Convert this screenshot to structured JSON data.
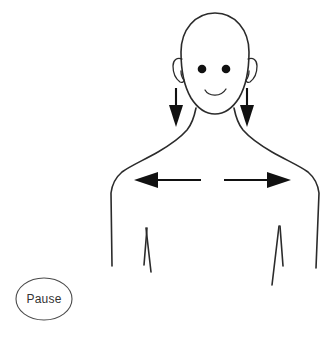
{
  "canvas": {
    "width": 330,
    "height": 337,
    "background": "#ffffff"
  },
  "controls": {
    "pause_button": {
      "label": "Pause",
      "shape": "ellipse",
      "text_color": "#333333",
      "border_color": "#4a4a4a",
      "fill_color": "#ffffff",
      "center_x": 44,
      "center_y": 299,
      "radius_x": 28,
      "radius_y": 21
    }
  },
  "figure": {
    "name": "torso-and-head-outline",
    "stroke_color": "#2b2b2b",
    "stroke_width": 1.6,
    "parts": [
      {
        "name": "head",
        "type": "oval-outline"
      },
      {
        "name": "left-ear",
        "type": "curved-flap"
      },
      {
        "name": "right-ear",
        "type": "curved-flap"
      },
      {
        "name": "left-eye",
        "type": "filled-dot",
        "cx": 202,
        "cy": 69,
        "r": 4.2
      },
      {
        "name": "right-eye",
        "type": "filled-dot",
        "cx": 226,
        "cy": 69,
        "r": 4.2
      },
      {
        "name": "mouth",
        "type": "smile-curve"
      },
      {
        "name": "neck",
        "type": "two-lines"
      },
      {
        "name": "left-shoulder",
        "type": "trapezius-curve"
      },
      {
        "name": "right-shoulder",
        "type": "trapezius-curve"
      },
      {
        "name": "left-arm",
        "type": "outer-arm-line"
      },
      {
        "name": "right-arm",
        "type": "outer-arm-line"
      },
      {
        "name": "left-armpit",
        "type": "v-crease"
      },
      {
        "name": "right-armpit",
        "type": "v-crease"
      }
    ]
  },
  "annotations": {
    "stroke_color": "#111111",
    "arrows": [
      {
        "name": "left-shoulder-down-arrow",
        "direction": "down",
        "meaning": "drop left shoulder down",
        "x": 176,
        "y_start": 88,
        "y_end": 126
      },
      {
        "name": "right-shoulder-down-arrow",
        "direction": "down",
        "meaning": "drop right shoulder down",
        "x": 247,
        "y_start": 88,
        "y_end": 126
      },
      {
        "name": "chest-left-arrow",
        "direction": "left",
        "meaning": "open chest outward to the left",
        "y": 180,
        "x_tail": 201,
        "x_tip": 135
      },
      {
        "name": "chest-right-arrow",
        "direction": "right",
        "meaning": "open chest outward to the right",
        "y": 180,
        "x_tail": 224,
        "x_tip": 291
      }
    ]
  }
}
